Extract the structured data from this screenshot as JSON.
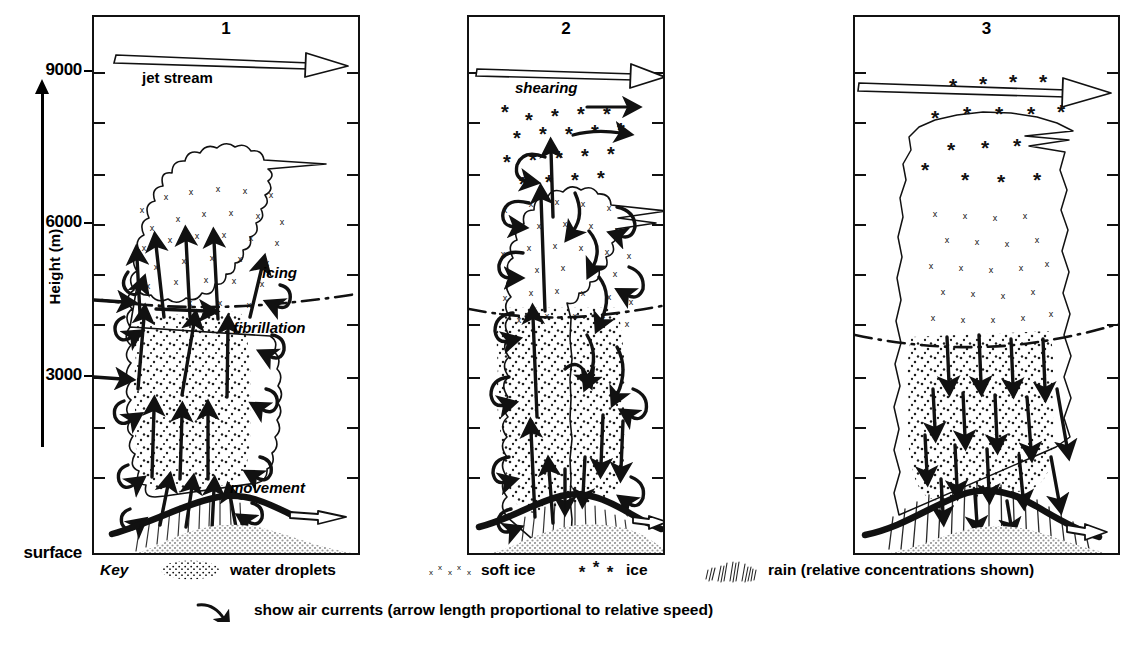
{
  "figure": {
    "type": "meteorological-cross-section"
  },
  "axis": {
    "title": "Height (m)",
    "unit": "m",
    "labels": [
      {
        "text": "9000",
        "value": 9000,
        "y": 70
      },
      {
        "text": "6000",
        "value": 6000,
        "y": 222
      },
      {
        "text": "3000",
        "value": 3000,
        "y": 375
      },
      {
        "text": "surface",
        "value": 0,
        "y": 553
      }
    ],
    "minor_ticks": [
      {
        "value": 10500,
        "y": 18
      },
      {
        "value": 7500,
        "y": 120
      },
      {
        "value": 4500,
        "y": 172
      },
      {
        "value": 4500,
        "y": 272
      },
      {
        "value": 3750,
        "y": 322
      },
      {
        "value": 2250,
        "y": 425
      },
      {
        "value": 1500,
        "y": 475
      }
    ],
    "range": [
      0,
      10500
    ],
    "tick_interval": 1500
  },
  "panels": [
    {
      "number": "1",
      "stage_name": "developing",
      "labels": [
        {
          "text": "jet stream",
          "style": "bold"
        },
        {
          "text": "icing",
          "style": "italic"
        },
        {
          "text": "fibrillation",
          "style": "italic"
        },
        {
          "text": "movement",
          "style": "italic"
        }
      ],
      "cloud_top_m": 6800,
      "cloud_base_m": 1100,
      "freezing_level_m": 4500,
      "dominant_airflow": "updraft",
      "precipitation": "light",
      "contents": [
        "water droplets",
        "soft ice"
      ]
    },
    {
      "number": "2",
      "stage_name": "mature",
      "labels": [
        {
          "text": "shearing",
          "style": "italic"
        }
      ],
      "cloud_top_m": 9200,
      "cloud_base_m": 900,
      "freezing_level_m": 4500,
      "dominant_airflow": "updraft and downdraft",
      "precipitation": "moderate",
      "contents": [
        "water droplets",
        "soft ice",
        "ice"
      ]
    },
    {
      "number": "3",
      "stage_name": "dissipating",
      "labels": [],
      "cloud_top_m": 9400,
      "cloud_base_m": 900,
      "freezing_level_m": 4500,
      "dominant_airflow": "downdraft",
      "precipitation": "heavy",
      "contents": [
        "ice",
        "soft ice",
        "rain"
      ]
    }
  ],
  "key": {
    "title": "Key",
    "items": [
      {
        "symbol": "stipple",
        "label": "water droplets"
      },
      {
        "symbol": "x-marks",
        "label": "soft ice"
      },
      {
        "symbol": "asterisks",
        "label": "ice"
      },
      {
        "symbol": "hatching",
        "label": "rain (relative concentrations shown)"
      }
    ],
    "arrow_note": "show air currents (arrow length proportional to relative speed)"
  },
  "colors": {
    "ink": "#111111",
    "paper": "#ffffff",
    "ground_fill": "#b9b9b9"
  }
}
